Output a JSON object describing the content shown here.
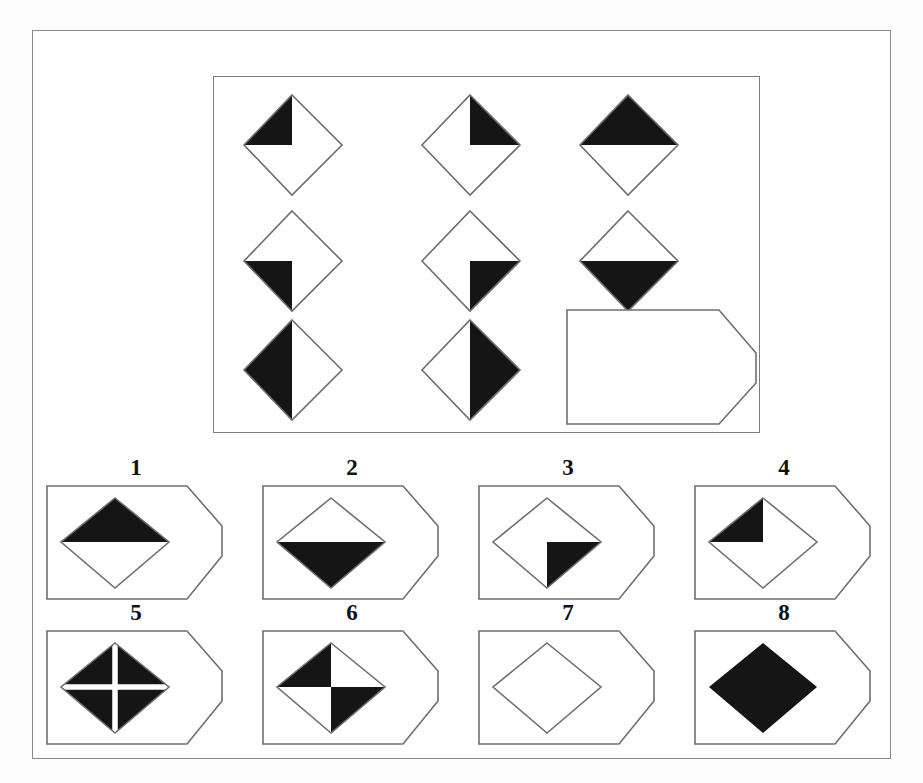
{
  "puzzle": {
    "type": "matrix-reasoning",
    "title": "Progressive Matrices Item",
    "frame": {
      "x": 32,
      "y": 30,
      "width": 859,
      "height": 729
    },
    "matrix": {
      "x": 180,
      "y": 45,
      "width": 547,
      "height": 357,
      "rows": 3,
      "cols": 3,
      "cells": [
        {
          "row": 1,
          "col": 1,
          "id": "cell-r1c1",
          "shape": "diamond",
          "filled_quadrants": [
            "top-left"
          ],
          "description": "Diamond with top-left quadrant black"
        },
        {
          "row": 1,
          "col": 2,
          "id": "cell-r1c2",
          "shape": "diamond",
          "filled_quadrants": [
            "top-right"
          ],
          "description": "Diamond with top-right quadrant black"
        },
        {
          "row": 1,
          "col": 3,
          "id": "cell-r1c3",
          "shape": "diamond",
          "filled_quadrants": [
            "top-left",
            "top-right"
          ],
          "description": "Diamond with top half black"
        },
        {
          "row": 2,
          "col": 1,
          "id": "cell-r2c1",
          "shape": "diamond",
          "filled_quadrants": [
            "bottom-left"
          ],
          "description": "Diamond with bottom-left quadrant black"
        },
        {
          "row": 2,
          "col": 2,
          "id": "cell-r2c2",
          "shape": "diamond",
          "filled_quadrants": [
            "bottom-right"
          ],
          "description": "Diamond with bottom-right quadrant black"
        },
        {
          "row": 2,
          "col": 3,
          "id": "cell-r2c3",
          "shape": "diamond",
          "filled_quadrants": [
            "bottom-left",
            "bottom-right"
          ],
          "description": "Diamond with bottom half black"
        },
        {
          "row": 3,
          "col": 1,
          "id": "cell-r3c1",
          "shape": "diamond",
          "filled_quadrants": [
            "top-left",
            "bottom-left"
          ],
          "description": "Diamond with left half black"
        },
        {
          "row": 3,
          "col": 2,
          "id": "cell-r3c2",
          "shape": "diamond",
          "filled_quadrants": [
            "top-right",
            "bottom-right"
          ],
          "description": "Diamond with right half black"
        },
        {
          "row": 3,
          "col": 3,
          "id": "cell-r3c3",
          "shape": "blank-tag",
          "filled_quadrants": [],
          "description": "Blank answer cell, tag shape with pointed right edge"
        }
      ]
    },
    "options": {
      "count": 8,
      "rows": 2,
      "cols": 4,
      "items": [
        {
          "number": "1",
          "id": "option-1",
          "shape": "diamond",
          "filled_quadrants": [
            "top-left",
            "top-right"
          ],
          "cross": false,
          "description": "Diamond with top half black"
        },
        {
          "number": "2",
          "id": "option-2",
          "shape": "diamond",
          "filled_quadrants": [
            "bottom-left",
            "bottom-right"
          ],
          "cross": false,
          "description": "Diamond with bottom half black"
        },
        {
          "number": "3",
          "id": "option-3",
          "shape": "diamond",
          "filled_quadrants": [
            "bottom-right"
          ],
          "cross": false,
          "description": "Diamond with bottom-right quadrant black"
        },
        {
          "number": "4",
          "id": "option-4",
          "shape": "diamond",
          "filled_quadrants": [
            "top-left"
          ],
          "cross": false,
          "description": "Diamond with top-left quadrant black"
        },
        {
          "number": "5",
          "id": "option-5",
          "shape": "diamond",
          "filled_quadrants": [
            "top-left",
            "top-right",
            "bottom-left",
            "bottom-right"
          ],
          "cross": true,
          "description": "Fully black diamond with white cross dividers"
        },
        {
          "number": "6",
          "id": "option-6",
          "shape": "diamond",
          "filled_quadrants": [
            "top-left",
            "bottom-right"
          ],
          "cross": false,
          "description": "Diamond checkerboard, top-left and bottom-right black"
        },
        {
          "number": "7",
          "id": "option-7",
          "shape": "diamond",
          "filled_quadrants": [],
          "cross": false,
          "description": "Empty outlined diamond"
        },
        {
          "number": "8",
          "id": "option-8",
          "shape": "diamond",
          "filled_quadrants": [
            "top-left",
            "top-right",
            "bottom-left",
            "bottom-right"
          ],
          "cross": false,
          "description": "Fully black diamond"
        }
      ]
    },
    "colors": {
      "fill_black": "#151515",
      "fill_white": "#ffffff",
      "stroke": "#6e6e6e",
      "frame_stroke": "#8a8a8a",
      "background": "#fdfdfd",
      "label_text": "#111111"
    }
  }
}
